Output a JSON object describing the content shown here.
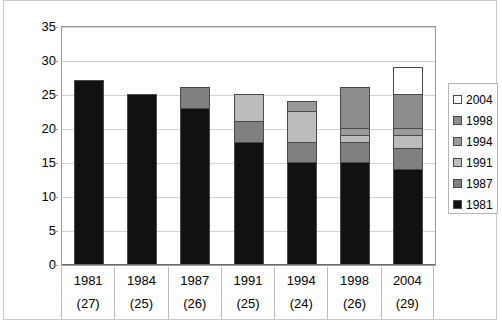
{
  "title": "",
  "chart_data": {
    "type": "bar",
    "title": "",
    "subtitle": "",
    "xlabel": "",
    "ylabel": "",
    "ylim": [
      0,
      35
    ],
    "ytick_step": 5,
    "yticks": [
      "35",
      "30",
      "25",
      "20",
      "15",
      "10",
      "5",
      "0"
    ],
    "grid": true,
    "stacked": true,
    "legend_position": "right",
    "categories": [
      "1981",
      "1984",
      "1987",
      "1991",
      "1994",
      "1998",
      "2004"
    ],
    "category_counts": [
      "(27)",
      "(25)",
      "(26)",
      "(25)",
      "(24)",
      "(26)",
      "(29)"
    ],
    "series": [
      {
        "name": "1981",
        "color": "#111111",
        "values": [
          27,
          25,
          23,
          18,
          15,
          15,
          14
        ]
      },
      {
        "name": "1987",
        "color": "#808080",
        "values": [
          0,
          0,
          3,
          3,
          3,
          3,
          3
        ]
      },
      {
        "name": "1991",
        "color": "#bcbcbc",
        "values": [
          0,
          0,
          0,
          4,
          4.5,
          1,
          2
        ]
      },
      {
        "name": "1994",
        "color": "#9a9a9a",
        "values": [
          0,
          0,
          0,
          0,
          1.5,
          1,
          1
        ]
      },
      {
        "name": "1998",
        "color": "#8c8c8c",
        "values": [
          0,
          0,
          0,
          0,
          0,
          6,
          5
        ]
      },
      {
        "name": "2004",
        "color": "#ffffff",
        "values": [
          0,
          0,
          0,
          0,
          0,
          0,
          4
        ]
      }
    ],
    "totals": [
      27,
      25,
      26,
      25,
      24,
      26,
      29
    ]
  },
  "legend": {
    "entries": [
      {
        "label": "2004",
        "color": "#ffffff"
      },
      {
        "label": "1998",
        "color": "#8c8c8c"
      },
      {
        "label": "1994",
        "color": "#9a9a9a"
      },
      {
        "label": "1991",
        "color": "#bcbcbc"
      },
      {
        "label": "1987",
        "color": "#808080"
      },
      {
        "label": "1981",
        "color": "#111111"
      }
    ]
  },
  "colors": {
    "plot_border": "#9a9a9a",
    "grid": "#d2d2d2",
    "frame": "#c9c9c9",
    "segment_border": "#4a4a4a"
  }
}
